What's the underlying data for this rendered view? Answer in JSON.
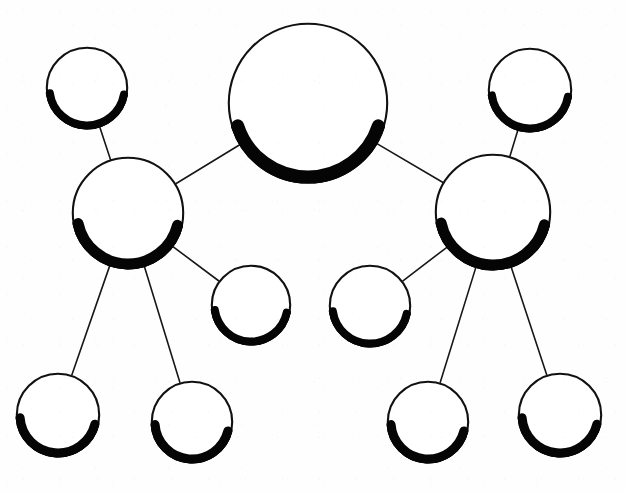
{
  "diagram": {
    "type": "node-link-tree",
    "canvas": {
      "width": 626,
      "height": 493,
      "background": "#ffffff"
    },
    "style": {
      "node_fill": "#ffffff",
      "node_stroke": "#111111",
      "node_stroke_width": 2.1,
      "shadow_color": "#050505",
      "edge_color": "#171717",
      "edge_width": 1.6
    },
    "nodes": [
      {
        "id": "root",
        "label": "",
        "cx": 308,
        "cy": 103,
        "r": 80,
        "shadow_width": 13,
        "shadow_start_deg": 18,
        "shadow_end_deg": 162,
        "role": "root"
      },
      {
        "id": "hub-left",
        "label": "",
        "cx": 128,
        "cy": 213,
        "r": 56,
        "shadow_width": 11,
        "shadow_start_deg": 14,
        "shadow_end_deg": 168,
        "role": "hub"
      },
      {
        "id": "hub-right",
        "label": "",
        "cx": 493,
        "cy": 212,
        "r": 58,
        "shadow_width": 11,
        "shadow_start_deg": 14,
        "shadow_end_deg": 168,
        "role": "hub"
      },
      {
        "id": "leaf-top-left",
        "label": "",
        "cx": 87,
        "cy": 88,
        "r": 41,
        "shadow_width": 8,
        "shadow_start_deg": 10,
        "shadow_end_deg": 172,
        "role": "leaf"
      },
      {
        "id": "leaf-top-right",
        "label": "",
        "cx": 530,
        "cy": 90,
        "r": 42,
        "shadow_width": 8,
        "shadow_start_deg": 10,
        "shadow_end_deg": 172,
        "role": "leaf"
      },
      {
        "id": "leaf-mid-left",
        "label": "",
        "cx": 251,
        "cy": 305,
        "r": 40,
        "shadow_width": 8,
        "shadow_start_deg": 12,
        "shadow_end_deg": 172,
        "role": "leaf"
      },
      {
        "id": "leaf-mid-right",
        "label": "",
        "cx": 370,
        "cy": 306,
        "r": 41,
        "shadow_width": 8,
        "shadow_start_deg": 12,
        "shadow_end_deg": 172,
        "role": "leaf"
      },
      {
        "id": "leaf-bot-1",
        "label": "",
        "cx": 58,
        "cy": 415,
        "r": 42,
        "shadow_width": 9,
        "shadow_start_deg": 14,
        "shadow_end_deg": 176,
        "role": "leaf"
      },
      {
        "id": "leaf-bot-2",
        "label": "",
        "cx": 192,
        "cy": 422,
        "r": 41,
        "shadow_width": 9,
        "shadow_start_deg": 14,
        "shadow_end_deg": 176,
        "role": "leaf"
      },
      {
        "id": "leaf-bot-3",
        "label": "",
        "cx": 428,
        "cy": 422,
        "r": 41,
        "shadow_width": 9,
        "shadow_start_deg": 14,
        "shadow_end_deg": 176,
        "role": "leaf"
      },
      {
        "id": "leaf-bot-4",
        "label": "",
        "cx": 560,
        "cy": 415,
        "r": 42,
        "shadow_width": 9,
        "shadow_start_deg": 14,
        "shadow_end_deg": 176,
        "role": "leaf"
      }
    ],
    "edges": [
      {
        "id": "edge-root-hub-left",
        "from": "root",
        "to": "hub-left"
      },
      {
        "id": "edge-root-hub-right",
        "from": "root",
        "to": "hub-right"
      },
      {
        "id": "edge-hubleft-topleft",
        "from": "hub-left",
        "to": "leaf-top-left"
      },
      {
        "id": "edge-hubleft-midleft",
        "from": "hub-left",
        "to": "leaf-mid-left"
      },
      {
        "id": "edge-hubleft-bot1",
        "from": "hub-left",
        "to": "leaf-bot-1"
      },
      {
        "id": "edge-hubleft-bot2",
        "from": "hub-left",
        "to": "leaf-bot-2"
      },
      {
        "id": "edge-hubright-topright",
        "from": "hub-right",
        "to": "leaf-top-right"
      },
      {
        "id": "edge-hubright-midright",
        "from": "hub-right",
        "to": "leaf-mid-right"
      },
      {
        "id": "edge-hubright-bot3",
        "from": "hub-right",
        "to": "leaf-bot-3"
      },
      {
        "id": "edge-hubright-bot4",
        "from": "hub-right",
        "to": "leaf-bot-4"
      }
    ]
  }
}
